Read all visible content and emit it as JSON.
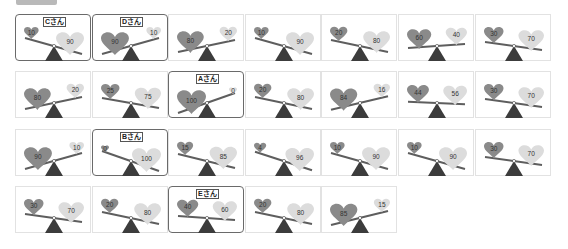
{
  "colors": {
    "heart_left": "#8a8a8a",
    "heart_right": "#dcdcdc",
    "beam": "#5e5e5e",
    "fulcrum": "#3c3c3c",
    "selected_border": "#6a6a6a"
  },
  "rows": [
    [
      {
        "left": 10,
        "right": 90,
        "label": "Cさん"
      },
      {
        "left": 90,
        "right": 10,
        "label": "Dさん"
      },
      {
        "left": 80,
        "right": 20
      },
      {
        "left": 10,
        "right": 90
      },
      {
        "left": 20,
        "right": 80
      },
      {
        "left": 60,
        "right": 40
      },
      {
        "left": 30,
        "right": 70
      }
    ],
    [
      {
        "left": 80,
        "right": 20
      },
      {
        "left": 25,
        "right": 75
      },
      {
        "left": 100,
        "right": 0,
        "label": "Aさん"
      },
      {
        "left": 20,
        "right": 80
      },
      {
        "left": 84,
        "right": 16
      },
      {
        "left": 44,
        "right": 56
      },
      {
        "left": 30,
        "right": 70
      }
    ],
    [
      {
        "left": 90,
        "right": 10
      },
      {
        "left": 0,
        "right": 100,
        "label": "Bさん"
      },
      {
        "left": 15,
        "right": 85
      },
      {
        "left": 4,
        "right": 96
      },
      {
        "left": 10,
        "right": 90
      },
      {
        "left": 10,
        "right": 90
      },
      {
        "left": 30,
        "right": 70
      }
    ],
    [
      {
        "left": 30,
        "right": 70
      },
      {
        "left": 20,
        "right": 80
      },
      {
        "left": 40,
        "right": 60,
        "label": "Eさん"
      },
      {
        "left": 20,
        "right": 80
      },
      {
        "left": 85,
        "right": 15
      }
    ]
  ]
}
